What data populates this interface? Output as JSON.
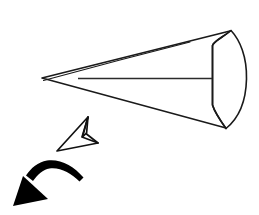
{
  "figure": {
    "background_color": "#ffffff",
    "stroke_color": "#1a1a1a",
    "fill_color": "#ffffff",
    "solid_color": "#000000",
    "width": 259,
    "height": 215
  },
  "chart_data": {
    "type": "diagram",
    "background": "#ffffff",
    "shapes": [
      {
        "name": "cone-body",
        "kind": "cone",
        "description": "Elongated cone seen from the side, apex at left, circular base at right",
        "apex": [
          42,
          78
        ],
        "base_top": [
          230,
          31
        ],
        "base_bottom": [
          226,
          128
        ],
        "stroke": "#1a1a1a",
        "fill": "#ffffff",
        "stroke_width": 1.6
      },
      {
        "name": "cone-base-face",
        "kind": "lens",
        "description": "Base disc drawn as a lens: convex outer arc on the right, concave inner curve on the left",
        "outer_arc_from": [
          230,
          31
        ],
        "outer_arc_to": [
          226,
          128
        ],
        "outer_arc_bulge_x": 247,
        "inner_edge_x": 212,
        "inner_edge_top_y": 45,
        "inner_edge_bottom_y": 105,
        "stroke": "#1a1a1a",
        "fill": "#ffffff"
      },
      {
        "name": "cone-axis",
        "kind": "line",
        "description": "Horizontal centre axis from near the apex to the base face",
        "from": [
          78,
          78
        ],
        "to": [
          212,
          78
        ],
        "stroke": "#2b2b2b",
        "stroke_width": 1.6
      },
      {
        "name": "direction-arrowhead",
        "kind": "outlined-3d-arrowhead",
        "description": "Unfilled three dimensional arrowhead pointing up and to the right",
        "tip": [
          88,
          117
        ],
        "left_vertex": [
          57,
          151
        ],
        "right_vertex": [
          98,
          143
        ],
        "fold_vertex": [
          82,
          137
        ],
        "stroke": "#111111",
        "fill": "#ffffff",
        "stroke_width": 1.7
      },
      {
        "name": "rotation-arrow",
        "kind": "curved-arrow",
        "description": "Solid black curved arrow sweeping left and downward",
        "tail_end": [
          83,
          177
        ],
        "curve_peak": [
          50,
          162
        ],
        "head_tip": [
          13,
          206
        ],
        "head_base_top": [
          23,
          176
        ],
        "head_base_bottom": [
          48,
          199
        ],
        "fill": "#000000"
      }
    ]
  }
}
